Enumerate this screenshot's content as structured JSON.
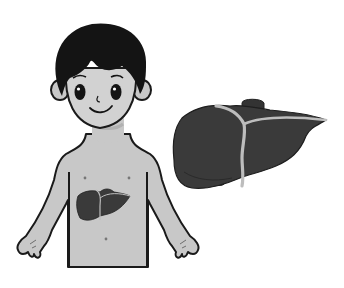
{
  "illustration": {
    "title": "Boy with liver illustration",
    "figures": [
      {
        "name": "boy",
        "description": "Smiling boy with black hair, shirtless, liver shown on torso"
      },
      {
        "name": "liver-enlarged",
        "description": "Enlarged liver illustration with ligament and gallbladder"
      }
    ]
  },
  "colors": {
    "background": "#ffffff",
    "skin": "#c8c8c8",
    "outline": "#1a1a1a",
    "hair": "#141414",
    "liver": "#3a3a3a",
    "ligament": "#bdbdbd"
  }
}
